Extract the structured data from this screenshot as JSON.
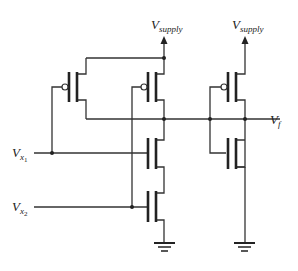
{
  "diagram": {
    "type": "CMOS logic gate schematic",
    "labels": {
      "vsupply_1": {
        "main": "V",
        "sub": "supply"
      },
      "vsupply_2": {
        "main": "V",
        "sub": "supply"
      },
      "vf": {
        "main": "V",
        "sub": "f"
      },
      "vx1": {
        "main": "V",
        "sub": "x",
        "subsub": "1"
      },
      "vx2": {
        "main": "V",
        "sub": "x",
        "subsub": "2"
      }
    },
    "transistors": [
      {
        "id": "M1",
        "kind": "PMOS",
        "gate": "Vx1"
      },
      {
        "id": "M2",
        "kind": "PMOS",
        "gate": "Vx2"
      },
      {
        "id": "M3",
        "kind": "NMOS",
        "gate": "Vx1"
      },
      {
        "id": "M4",
        "kind": "NMOS",
        "gate": "Vx2"
      },
      {
        "id": "M5",
        "kind": "PMOS",
        "gate": "internal node"
      },
      {
        "id": "M6",
        "kind": "NMOS",
        "gate": "internal node"
      }
    ],
    "colors": {
      "wire": "#333333",
      "device": "#222222",
      "background": "#ffffff"
    }
  }
}
